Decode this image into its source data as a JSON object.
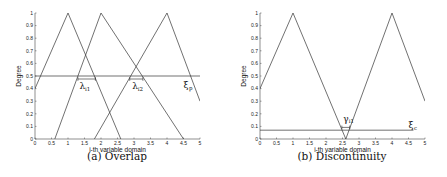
{
  "chart_data": [
    {
      "type": "line",
      "title": "",
      "caption": "(a) Overlap",
      "xlabel": "i-th variable domain",
      "ylabel": "Degree",
      "xlim": [
        0,
        5
      ],
      "ylim": [
        0,
        1
      ],
      "xticks": [
        "0",
        "0.5",
        "1",
        "1.5",
        "2",
        "2.5",
        "3",
        "3.5",
        "4",
        "4.5",
        "5"
      ],
      "yticks": [
        "0",
        "0.1",
        "0.2",
        "0.3",
        "0.4",
        "0.5",
        "0.6",
        "0.7",
        "0.8",
        "0.9",
        "1"
      ],
      "grid": false,
      "series": [
        {
          "name": "MF1",
          "x": [
            0,
            1,
            2.6
          ],
          "y": [
            0.4,
            1,
            0
          ]
        },
        {
          "name": "MF2",
          "x": [
            0.6,
            2,
            4.5
          ],
          "y": [
            0,
            1,
            0
          ]
        },
        {
          "name": "MF3",
          "x": [
            1.8,
            4,
            5
          ],
          "y": [
            0,
            1,
            0.3
          ]
        },
        {
          "name": "threshold",
          "x": [
            0,
            5
          ],
          "y": [
            0.5,
            0.5
          ]
        }
      ],
      "annotations": [
        {
          "text": "λ",
          "sub": "i1",
          "x": 1.6,
          "y": 0.42
        },
        {
          "text": "λ",
          "sub": "i2",
          "x": 3.1,
          "y": 0.42
        },
        {
          "text": "ξ",
          "sub": "p",
          "x": 4.65,
          "y": 0.45
        }
      ]
    },
    {
      "type": "line",
      "title": "",
      "caption": "(b) Discontinuity",
      "xlabel": "i-th variable domain",
      "ylabel": "Degree",
      "xlim": [
        0,
        5
      ],
      "ylim": [
        0,
        1
      ],
      "xticks": [
        "0",
        "0.5",
        "1",
        "1.5",
        "2",
        "2.5",
        "3",
        "3.5",
        "4",
        "4.5",
        "5"
      ],
      "yticks": [
        "0",
        "0.1",
        "0.2",
        "0.3",
        "0.4",
        "0.5",
        "0.6",
        "0.7",
        "0.8",
        "0.9",
        "1"
      ],
      "grid": false,
      "series": [
        {
          "name": "MF1",
          "x": [
            0,
            1,
            2.6
          ],
          "y": [
            0.4,
            1,
            0
          ]
        },
        {
          "name": "MF2",
          "x": [
            2.6,
            4,
            5
          ],
          "y": [
            0,
            1,
            0.3
          ]
        },
        {
          "name": "threshold",
          "x": [
            0,
            4.65
          ],
          "y": [
            0.07,
            0.07
          ]
        }
      ],
      "annotations": [
        {
          "text": "γ",
          "sub": "i1",
          "x": 2.6,
          "y": 0.17
        },
        {
          "text": "ξ",
          "sub": "c",
          "x": 4.65,
          "y": 0.1
        }
      ]
    }
  ]
}
